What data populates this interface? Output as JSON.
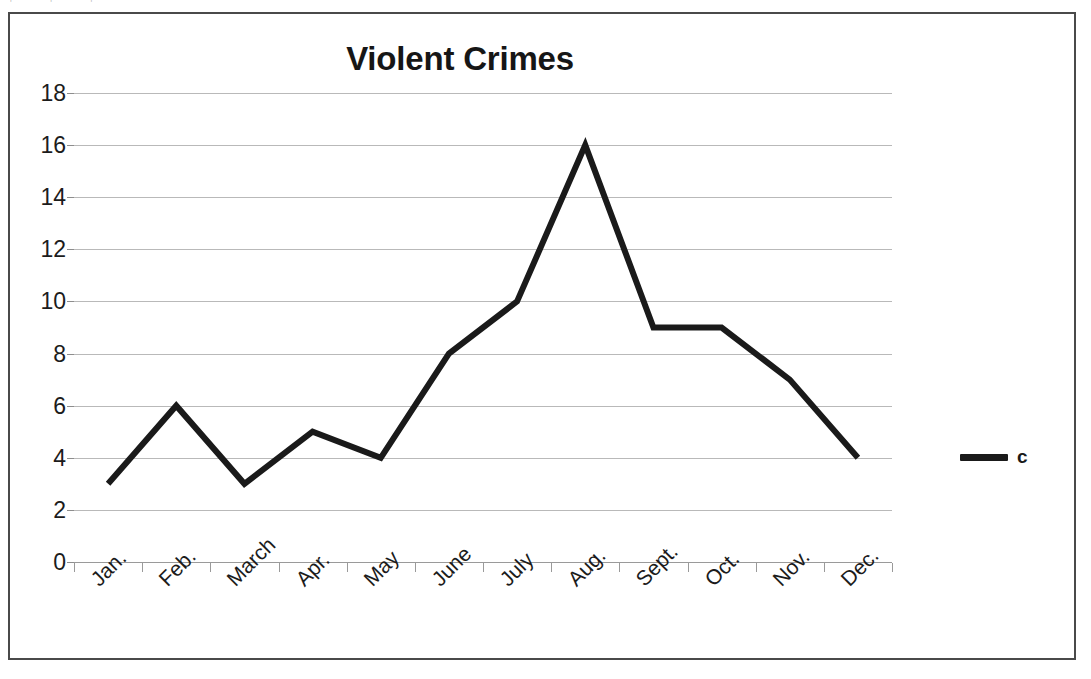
{
  "scan": {
    "top_artifact_text": "' ' '"
  },
  "chart_data": {
    "type": "line",
    "title": "Violent Crimes",
    "xlabel": "",
    "ylabel": "",
    "categories": [
      "Jan.",
      "Feb.",
      "March",
      "Apr.",
      "May",
      "June",
      "July",
      "Aug.",
      "Sept.",
      "Oct.",
      "Nov.",
      "Dec."
    ],
    "values": [
      3,
      6,
      3,
      5,
      4,
      8,
      10,
      16,
      9,
      9,
      7,
      4
    ],
    "series": [
      {
        "name": "c",
        "values": [
          3,
          6,
          3,
          5,
          4,
          8,
          10,
          16,
          9,
          9,
          7,
          4
        ],
        "color": "#1a1a1a"
      }
    ],
    "ylim": [
      0,
      18
    ],
    "ytick_step": 2,
    "yticks": [
      18,
      16,
      14,
      12,
      10,
      8,
      6,
      4,
      2,
      0
    ],
    "grid": true,
    "grid_axis": "y",
    "legend": {
      "position": "right",
      "entries": [
        {
          "label": "c",
          "color": "#1a1a1a",
          "marker": "line"
        }
      ]
    },
    "xtick_rotation": -45,
    "line_width": 6,
    "colors": {
      "line": "#1a1a1a",
      "grid": "#b9b9b9",
      "axis": "#9a9a9a",
      "frame": "#4a4a4a",
      "text": "#1b1b1b"
    }
  }
}
